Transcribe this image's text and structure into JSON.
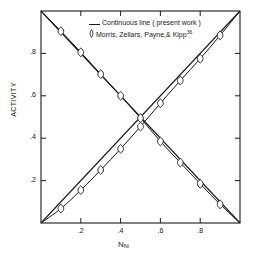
{
  "chart_data": {
    "type": "line",
    "title": "",
    "xlabel": "N_Ni",
    "xlabel_base": "N",
    "xlabel_sub": "Ni",
    "ylabel": "ACTIVITY",
    "xlim": [
      0,
      1
    ],
    "ylim": [
      0,
      1
    ],
    "xticks": [
      0.2,
      0.4,
      0.6,
      0.8
    ],
    "yticks": [
      0.2,
      0.4,
      0.6,
      0.8
    ],
    "xtick_labels": [
      ".2",
      ".4",
      ".6",
      ".8"
    ],
    "ytick_labels": [
      ".2",
      ".4",
      ".6",
      ".8"
    ],
    "grid": false,
    "frame": "box-all-four-sides-inward-ticks",
    "legend_position": "top-center-inside",
    "series": [
      {
        "name": "ideal-ascending",
        "style": "straight-line",
        "description": "Raoult's law ideal straight line, rising left to right",
        "x": [
          0.0,
          1.0
        ],
        "values": [
          0.0,
          1.0
        ]
      },
      {
        "name": "ideal-descending",
        "style": "straight-line",
        "description": "Raoult's law ideal straight line, falling left to right",
        "x": [
          0.0,
          1.0
        ],
        "values": [
          1.0,
          0.0
        ]
      },
      {
        "name": "activity-descending-present-work",
        "style": "continuous-line-with-markers",
        "description": "Activity curve decreasing with N_Ni, negative deviation below ideal",
        "x": [
          0.0,
          0.1,
          0.2,
          0.3,
          0.4,
          0.5,
          0.6,
          0.7,
          0.8,
          0.9,
          1.0
        ],
        "values": [
          1.0,
          0.905,
          0.805,
          0.702,
          0.6,
          0.495,
          0.385,
          0.285,
          0.185,
          0.088,
          0.0
        ]
      },
      {
        "name": "activity-ascending-present-work",
        "style": "continuous-line-with-markers",
        "description": "Activity curve increasing with N_Ni, negative deviation below ideal",
        "x": [
          0.0,
          0.1,
          0.2,
          0.3,
          0.4,
          0.5,
          0.6,
          0.7,
          0.8,
          0.9,
          1.0
        ],
        "values": [
          0.0,
          0.068,
          0.155,
          0.25,
          0.35,
          0.455,
          0.565,
          0.672,
          0.775,
          0.885,
          1.0
        ]
      }
    ],
    "markers": {
      "descending_points": [
        {
          "x": 0.1,
          "y": 0.905
        },
        {
          "x": 0.2,
          "y": 0.805
        },
        {
          "x": 0.3,
          "y": 0.702
        },
        {
          "x": 0.4,
          "y": 0.6
        },
        {
          "x": 0.5,
          "y": 0.495
        },
        {
          "x": 0.6,
          "y": 0.385
        },
        {
          "x": 0.7,
          "y": 0.285
        },
        {
          "x": 0.8,
          "y": 0.185
        },
        {
          "x": 0.9,
          "y": 0.088
        }
      ],
      "ascending_points": [
        {
          "x": 0.1,
          "y": 0.068
        },
        {
          "x": 0.2,
          "y": 0.155
        },
        {
          "x": 0.3,
          "y": 0.25
        },
        {
          "x": 0.4,
          "y": 0.35
        },
        {
          "x": 0.5,
          "y": 0.455
        },
        {
          "x": 0.6,
          "y": 0.565
        },
        {
          "x": 0.7,
          "y": 0.672
        },
        {
          "x": 0.8,
          "y": 0.775
        },
        {
          "x": 0.9,
          "y": 0.885
        }
      ]
    },
    "legend": [
      {
        "symbol": "line",
        "label": "Continuous line ( present work )"
      },
      {
        "symbol": "lens-marker",
        "label": "Morris, Zellars, Payne,& Kipp",
        "superscript": "36"
      }
    ],
    "colors": {
      "line": "#1a1a1a",
      "axis": "#1a1a1a",
      "marker_stroke": "#1a1a1a",
      "marker_fill": "#ffffff",
      "background": "#ffffff"
    }
  }
}
